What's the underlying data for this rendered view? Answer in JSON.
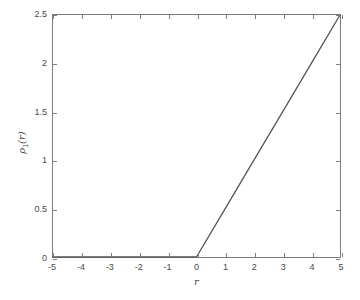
{
  "chart_data": {
    "type": "line",
    "title": "",
    "subtitle": "",
    "xlabel": "r",
    "ylabel": "ρ₁(r)",
    "ylabel_parts": {
      "symbol": "ρ",
      "subscript": "1",
      "argument": "(r)"
    },
    "xlim": [
      -5,
      5
    ],
    "ylim": [
      0,
      2.5
    ],
    "xticks": [
      -5,
      -4,
      -3,
      -2,
      -1,
      0,
      1,
      2,
      3,
      4,
      5
    ],
    "xticklabels": [
      "-5",
      "-4",
      "-3",
      "-2",
      "-1",
      "0",
      "1",
      "2",
      "3",
      "4",
      "5"
    ],
    "yticks": [
      0,
      0.5,
      1,
      1.5,
      2,
      2.5
    ],
    "yticklabels": [
      "0",
      "0.5",
      "1",
      "1.5",
      "2",
      "2.5"
    ],
    "grid": false,
    "legend": null,
    "series": [
      {
        "name": "ρ₁(r)",
        "color": "#555555",
        "linewidth": 1.2,
        "x": [
          -5,
          -4,
          -3,
          -2,
          -1,
          0,
          1,
          2,
          3,
          4,
          5
        ],
        "values": [
          0,
          0,
          0,
          0,
          0,
          0,
          0.5,
          1.0,
          1.5,
          2.0,
          2.5
        ]
      }
    ],
    "annotations": []
  },
  "axes": {
    "frame_color": "#7d7d7d",
    "tick_color": "#7d7d7d",
    "label_color": "#4a4a4a",
    "background": "#ffffff"
  }
}
